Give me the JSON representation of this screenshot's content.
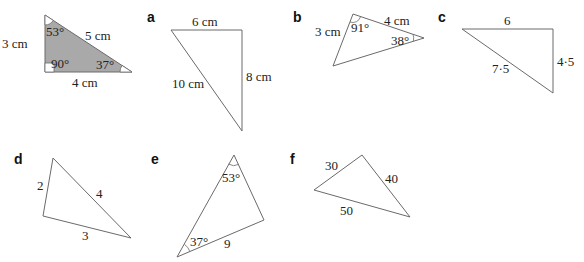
{
  "example": {
    "side_left": "3 cm",
    "side_hyp": "5 cm",
    "side_bottom": "4 cm",
    "angle_top": "53°",
    "angle_right_angle": "90°",
    "angle_right": "37°"
  },
  "parts": [
    {
      "id": "a",
      "label": "a",
      "sides": [
        "6 cm",
        "8 cm",
        "10 cm"
      ]
    },
    {
      "id": "b",
      "label": "b",
      "sides": [
        "3 cm",
        "4 cm"
      ],
      "angles": [
        "91°",
        "38°"
      ]
    },
    {
      "id": "c",
      "label": "c",
      "sides": [
        "6",
        "4·5",
        "7·5"
      ]
    },
    {
      "id": "d",
      "label": "d",
      "sides": [
        "2",
        "4",
        "3"
      ]
    },
    {
      "id": "e",
      "label": "e",
      "sides": [
        "9"
      ],
      "angles": [
        "53°",
        "37°"
      ]
    },
    {
      "id": "f",
      "label": "f",
      "sides": [
        "30",
        "40",
        "50"
      ]
    }
  ],
  "colors": {
    "shade": "#a9a9a9",
    "stroke": "#6a6a6a",
    "text": "#222222"
  }
}
